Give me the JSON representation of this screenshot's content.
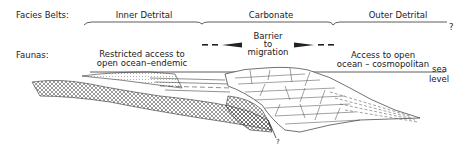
{
  "row_labels": {
    "facies": "Facies Belts:",
    "faunas": "Faunas:"
  },
  "facies_belts": [
    {
      "label": "Inner Detrital"
    },
    {
      "label": "Carbonate"
    },
    {
      "label": "Outer Detrital"
    }
  ],
  "facies_end_mark": "?",
  "faunas": {
    "inner": {
      "line1": "Restricted access to",
      "line2": "open ocean–endemic"
    },
    "barrier": {
      "line1": "Barrier",
      "line2": "to",
      "line3": "migration"
    },
    "outer": {
      "line1": "Access to open",
      "line2": "ocean – cosmopolitan"
    }
  },
  "sea_level": {
    "line1": "sea",
    "line2": "level"
  },
  "bottom_mark": "?"
}
